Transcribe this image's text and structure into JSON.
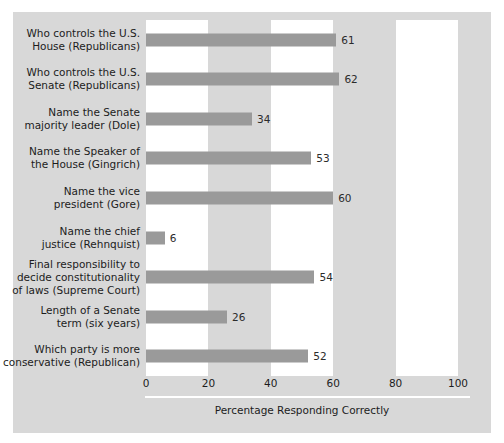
{
  "chart_data": {
    "type": "bar",
    "orientation": "horizontal",
    "title": "",
    "xlabel": "Percentage Responding Correctly",
    "ylabel": "",
    "xlim": [
      0,
      100
    ],
    "xticks": [
      "0",
      "20",
      "40",
      "60",
      "80",
      "100"
    ],
    "grid": false,
    "legend": null,
    "bands": [
      {
        "from": 0,
        "to": 20,
        "color": "#ffffff"
      },
      {
        "from": 40,
        "to": 60,
        "color": "#ffffff"
      },
      {
        "from": 80,
        "to": 100,
        "color": "#ffffff"
      }
    ],
    "bar_color": "#9a9a9a",
    "panel_color": "#d8d8d8",
    "categories": [
      "Who controls the U.S.\nHouse (Republicans)",
      "Who controls the U.S.\nSenate (Republicans)",
      "Name the Senate\nmajority leader (Dole)",
      "Name the Speaker of\nthe House (Gingrich)",
      "Name the vice\npresident (Gore)",
      "Name the chief\njustice (Rehnquist)",
      "Final responsibility to\ndecide constitutionality\nof laws (Supreme Court)",
      "Length of a Senate\nterm (six years)",
      "Which party is more\nconservative (Republican)"
    ],
    "values": [
      61,
      62,
      34,
      53,
      60,
      6,
      54,
      26,
      52
    ],
    "value_labels": [
      "61",
      "62",
      "34",
      "53",
      "60",
      "6",
      "54",
      "26",
      "52"
    ]
  }
}
